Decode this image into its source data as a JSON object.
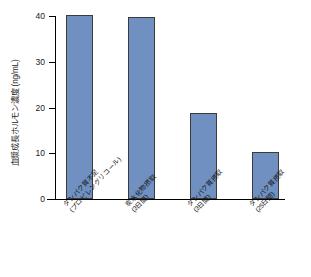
{
  "chart_data": {
    "type": "bar",
    "title": "",
    "xlabel": "",
    "ylabel": "血漿成長ホルモン濃度 (ng/mL)",
    "ylim": [
      0,
      40
    ],
    "yticks": [
      0,
      10,
      20,
      30,
      40
    ],
    "ytick_labels": [
      "0",
      "10",
      "20",
      "30",
      "40"
    ],
    "grid": false,
    "legend": null,
    "bar_color": "#6f90c1",
    "bar_edge_color": "#3b3b3b",
    "axis_color": "#000000",
    "categories": [
      "タンパク質不足 (プロピレングリコール)",
      "炭水化物摂取 (3日間)",
      "タンパク質摂取 (3日間)",
      "タンパク質摂取 (25日間)"
    ],
    "category_lines": [
      [
        "タンパク質不足",
        "(プロピレングリコール)"
      ],
      [
        "炭水化物摂取",
        "(3日間)"
      ],
      [
        "タンパク質摂取",
        "(3日間)"
      ],
      [
        "タンパク質摂取",
        "(25日間)"
      ]
    ],
    "values": [
      40.2,
      39.8,
      18.7,
      10.3
    ]
  }
}
